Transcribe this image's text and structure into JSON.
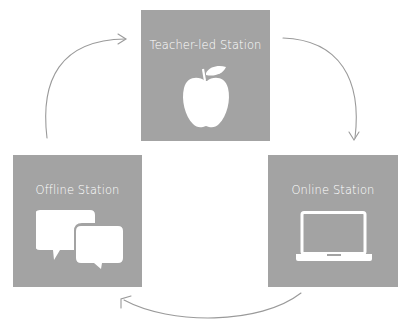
{
  "diagram": {
    "type": "cycle",
    "colors": {
      "box": "#a3a3a3",
      "text": "#ffffff",
      "arrow": "#9a9a9a",
      "background": "#ffffff"
    },
    "stations": [
      {
        "id": "teacher",
        "label": "Teacher-led Station",
        "icon": "apple-icon"
      },
      {
        "id": "online",
        "label": "Online Station",
        "icon": "laptop-icon"
      },
      {
        "id": "offline",
        "label": "Offline Station",
        "icon": "speech-bubbles-icon"
      }
    ],
    "flow": [
      {
        "from": "teacher",
        "to": "online"
      },
      {
        "from": "online",
        "to": "offline"
      },
      {
        "from": "offline",
        "to": "teacher"
      }
    ]
  }
}
